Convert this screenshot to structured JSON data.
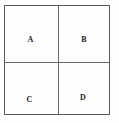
{
  "figure": {
    "type": "quadrant-diagram",
    "colors": {
      "background": "#fefefe",
      "border": "#58585a",
      "divider": "#6a6a6c",
      "label": "#1c1c1c"
    },
    "grid": {
      "rows": 2,
      "columns": 2
    },
    "cells": [
      {
        "id": "a",
        "label": "A",
        "position": "top-left"
      },
      {
        "id": "b",
        "label": "B",
        "position": "top-right"
      },
      {
        "id": "c",
        "label": "C",
        "position": "bottom-left"
      },
      {
        "id": "d",
        "label": "D",
        "position": "bottom-right"
      }
    ]
  }
}
